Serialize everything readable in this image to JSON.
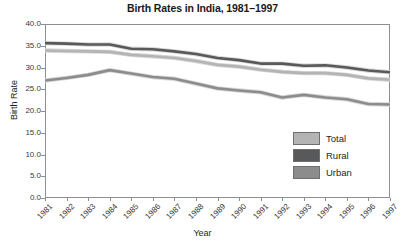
{
  "chart_data": {
    "type": "line",
    "title": "Birth Rates in India, 1981–1997",
    "xlabel": "Year",
    "ylabel": "Birth Rate",
    "categories": [
      "1981",
      "1982",
      "1983",
      "1984",
      "1985",
      "1986",
      "1987",
      "1988",
      "1989",
      "1990",
      "1991",
      "1992",
      "1993",
      "1994",
      "1995",
      "1996",
      "1997"
    ],
    "x": [
      1981,
      1982,
      1983,
      1984,
      1985,
      1986,
      1987,
      1988,
      1989,
      1990,
      1991,
      1992,
      1993,
      1994,
      1995,
      1996,
      1997
    ],
    "ylim": [
      0.0,
      40.0
    ],
    "ytick_labels": [
      "0.0",
      "5.0",
      "10.0",
      "15.0",
      "20.0",
      "25.0",
      "30.0",
      "35.0",
      "40.0"
    ],
    "ytick_values": [
      0.0,
      5.0,
      10.0,
      15.0,
      20.0,
      25.0,
      30.0,
      35.0,
      40.0
    ],
    "grid": false,
    "legend_position": "inside-bottom-right",
    "series": [
      {
        "name": "Total",
        "color": "#b4b4b4",
        "values": [
          33.9,
          33.8,
          33.7,
          33.6,
          32.9,
          32.6,
          32.2,
          31.5,
          30.6,
          30.2,
          29.5,
          29.0,
          28.7,
          28.7,
          28.3,
          27.5,
          27.2
        ]
      },
      {
        "name": "Rural",
        "color": "#58595b",
        "values": [
          35.6,
          35.5,
          35.3,
          35.3,
          34.3,
          34.2,
          33.7,
          33.1,
          32.2,
          31.7,
          30.9,
          30.9,
          30.4,
          30.5,
          30.0,
          29.3,
          28.9
        ]
      },
      {
        "name": "Urban",
        "color": "#8c8c8c",
        "values": [
          27.0,
          27.6,
          28.3,
          29.4,
          28.6,
          27.8,
          27.4,
          26.3,
          25.2,
          24.7,
          24.3,
          23.1,
          23.7,
          23.1,
          22.7,
          21.6,
          21.5
        ]
      }
    ]
  },
  "legend": {
    "items": [
      {
        "label": "Total"
      },
      {
        "label": "Rural"
      },
      {
        "label": "Urban"
      }
    ]
  }
}
